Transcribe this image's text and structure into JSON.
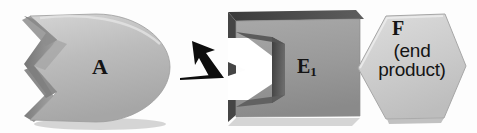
{
  "diagram": {
    "background_color": "#fdfdfd",
    "shapes": {
      "substrate_a": {
        "name": "A",
        "label": "A",
        "description": "rounded D-shape with V-notch on left side",
        "fill_color": "#b9b9b9",
        "edge_color": "#8f8f8f",
        "shade_color": "#787878"
      },
      "enzyme_e1": {
        "name": "E1",
        "label": "E",
        "subscript": "1",
        "description": "gray slab block with V-notch cut into left face and pointed right edge",
        "fill_color": "#9a9a9a",
        "top_color": "#4a4a4a",
        "shade_color": "#6e6e6e",
        "notch_color": "#ffffff"
      },
      "product_f": {
        "name": "F",
        "label": "F",
        "sublabel_line1": "(end",
        "sublabel_line2": "product)",
        "description": "light gray hexagon docked into right side of E1",
        "fill_color": "#cfcfcf",
        "edge_color": "#a9a9a9"
      }
    },
    "arrow": {
      "name": "release-arrow",
      "direction": "up-left",
      "color": "#0d0d0d",
      "description": "solid black arrow pointing up and to the left from the enzyme complex toward substrate A"
    }
  }
}
